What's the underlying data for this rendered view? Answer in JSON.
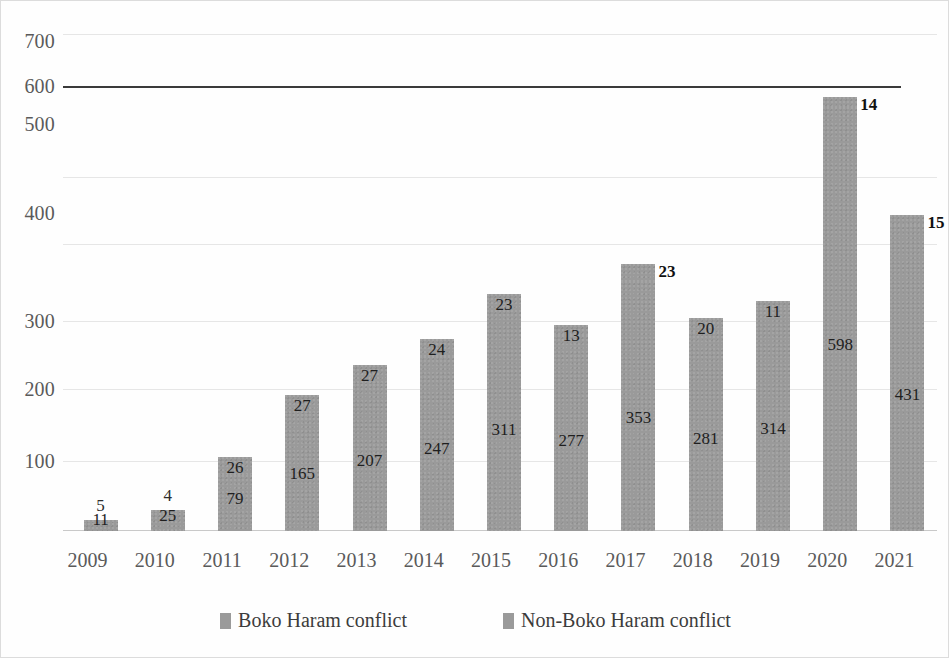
{
  "chart_data": {
    "type": "bar",
    "subtype": "stacked",
    "title": "",
    "subtitle": "",
    "xlabel": "",
    "ylabel": "",
    "categories": [
      "2009",
      "2010",
      "2011",
      "2012",
      "2013",
      "2014",
      "2015",
      "2016",
      "2017",
      "2018",
      "2019",
      "2020",
      "2021"
    ],
    "series": [
      {
        "name": "Boko Haram conflict",
        "color": "#9a9a9a",
        "values": [
          11,
          25,
          79,
          165,
          207,
          247,
          311,
          277,
          353,
          281,
          314,
          598,
          431
        ]
      },
      {
        "name": "Non-Boko Haram conflict",
        "color": "#9a9a9a",
        "values": [
          5,
          4,
          26,
          27,
          27,
          24,
          23,
          13,
          23,
          20,
          11,
          14,
          15
        ]
      }
    ],
    "totals": [
      16,
      29,
      105,
      192,
      234,
      271,
      334,
      290,
      376,
      301,
      325,
      612,
      446
    ],
    "ylim": [
      0,
      700
    ],
    "yticks": [
      100,
      200,
      300,
      400,
      500,
      600,
      700
    ],
    "ytick_labels": [
      "100",
      "200",
      "300",
      "400",
      "500",
      "600",
      "700"
    ],
    "grid": true,
    "grid_axis": "y",
    "legend_position": "bottom",
    "highlight_gridline": 600
  },
  "y_axis": {
    "ticks": [
      {
        "label": "700",
        "value": 700,
        "y_px": 22
      },
      {
        "label": "600",
        "value": 600,
        "y_px": 67
      },
      {
        "label": "500",
        "value": 500,
        "y_px": 105
      },
      {
        "label": "400",
        "value": 400,
        "y_px": 194
      },
      {
        "label": "300",
        "value": 300,
        "y_px": 302
      },
      {
        "label": "200",
        "value": 200,
        "y_px": 370
      },
      {
        "label": "100",
        "value": 100,
        "y_px": 442
      }
    ]
  },
  "x_axis": {
    "ticks": [
      "2009",
      "2010",
      "2011",
      "2012",
      "2013",
      "2014",
      "2015",
      "2016",
      "2017",
      "2018",
      "2019",
      "2020",
      "2021"
    ]
  },
  "gridlines": [
    {
      "y_px": 15,
      "style": "faint"
    },
    {
      "y_px": 67,
      "style": "major"
    },
    {
      "y_px": 158,
      "style": "faint"
    },
    {
      "y_px": 225,
      "style": "faint"
    },
    {
      "y_px": 302,
      "style": "faint"
    },
    {
      "y_px": 370,
      "style": "faint"
    },
    {
      "y_px": 442,
      "style": "faint"
    }
  ],
  "bars": [
    {
      "year": "2009",
      "main": 11,
      "top": 5,
      "main_label": "11",
      "top_label": "5",
      "top_label_mode": "above"
    },
    {
      "year": "2010",
      "main": 25,
      "top": 4,
      "main_label": "25",
      "top_label": "4",
      "top_label_mode": "above"
    },
    {
      "year": "2011",
      "main": 79,
      "top": 26,
      "main_label": "79",
      "top_label": "26",
      "top_label_mode": "inside"
    },
    {
      "year": "2012",
      "main": 165,
      "top": 27,
      "main_label": "165",
      "top_label": "27",
      "top_label_mode": "inside"
    },
    {
      "year": "2013",
      "main": 207,
      "top": 27,
      "main_label": "207",
      "top_label": "27",
      "top_label_mode": "inside"
    },
    {
      "year": "2014",
      "main": 247,
      "top": 24,
      "main_label": "247",
      "top_label": "24",
      "top_label_mode": "inside"
    },
    {
      "year": "2015",
      "main": 311,
      "top": 23,
      "main_label": "311",
      "top_label": "23",
      "top_label_mode": "inside"
    },
    {
      "year": "2016",
      "main": 277,
      "top": 13,
      "main_label": "277",
      "top_label": "13",
      "top_label_mode": "inside"
    },
    {
      "year": "2017",
      "main": 353,
      "top": 23,
      "main_label": "353",
      "top_label": "23",
      "top_label_mode": "outside"
    },
    {
      "year": "2018",
      "main": 281,
      "top": 20,
      "main_label": "281",
      "top_label": "20",
      "top_label_mode": "inside"
    },
    {
      "year": "2019",
      "main": 314,
      "top": 11,
      "main_label": "314",
      "top_label": "11",
      "top_label_mode": "inside"
    },
    {
      "year": "2020",
      "main": 598,
      "top": 14,
      "main_label": "598",
      "top_label": "14",
      "top_label_mode": "outside"
    },
    {
      "year": "2021",
      "main": 431,
      "top": 15,
      "main_label": "431",
      "top_label": "15",
      "top_label_mode": "outside"
    }
  ],
  "legend": {
    "items": [
      {
        "label": "Boko Haram conflict",
        "color": "#9a9a9a"
      },
      {
        "label": "Non-Boko Haram conflict",
        "color": "#9a9a9a"
      }
    ]
  }
}
